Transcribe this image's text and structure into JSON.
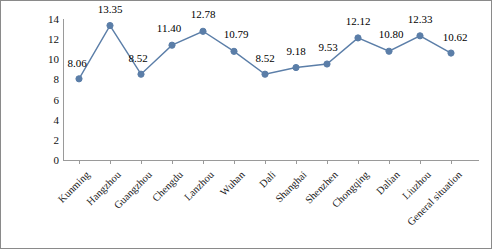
{
  "chart_data": {
    "type": "line",
    "title": "",
    "xlabel": "",
    "ylabel": "Average monthly income/yuan",
    "ylim": [
      0,
      14
    ],
    "yticks": [
      0,
      2,
      4,
      6,
      8,
      10,
      12,
      14
    ],
    "grid": false,
    "legend": null,
    "series_color": "#5b7ea8",
    "marker": "circle",
    "categories": [
      "Kunming",
      "Hangzhou",
      "Guangzhou",
      "Chengdu",
      "Lanzhou",
      "Wuhan",
      "Dali",
      "Shanghai",
      "Shenzhen",
      "Chongqing",
      "Dalian",
      "Liuzhou",
      "General situation"
    ],
    "values": [
      8.06,
      13.35,
      8.52,
      11.4,
      12.78,
      10.79,
      8.52,
      9.18,
      9.53,
      12.12,
      10.8,
      12.33,
      10.62
    ],
    "data_labels": [
      "8.06",
      "13.35",
      "8.52",
      "11.40",
      "12.78",
      "10.79",
      "8.52",
      "9.18",
      "9.53",
      "12.12",
      "10.80",
      "12.33",
      "10.62"
    ]
  }
}
